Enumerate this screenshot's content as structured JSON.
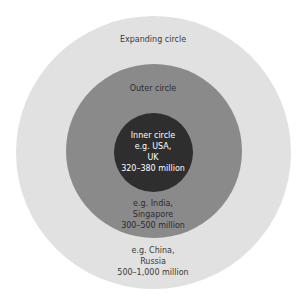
{
  "diagram": {
    "type": "concentric-circles",
    "colors": {
      "expanding": "#e1e1e1",
      "outer": "#8a8a8a",
      "inner": "#2e2e2e",
      "background": "#ffffff"
    },
    "expanding_circle": {
      "title": "Expanding circle",
      "example_line1": "e.g. China,",
      "example_line2": "Russia",
      "population": "500–1,000 million"
    },
    "outer_circle": {
      "title": "Outer circle",
      "example_line1": "e.g. India,",
      "example_line2": "Singapore",
      "population": "300–500 million"
    },
    "inner_circle": {
      "title": "Inner circle",
      "example_line1": "e.g. USA,",
      "example_line2": "UK",
      "population": "320–380 million"
    }
  }
}
